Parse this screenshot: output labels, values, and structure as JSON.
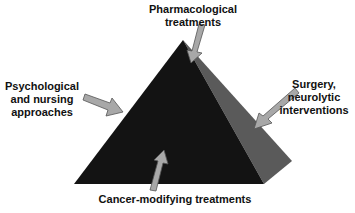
{
  "diagram": {
    "type": "pyramid",
    "colors": {
      "front_face": "#131313",
      "side_face": "#5a5a5a",
      "arrow_fill": "#a8a8a8",
      "arrow_stroke": "#555555",
      "text": "#111111",
      "background": "#ffffff"
    },
    "labels": {
      "top": {
        "line1": "Pharmacological",
        "line2": "treatments"
      },
      "left": {
        "line1": "Psychological",
        "line2": "and nursing",
        "line3": "approaches"
      },
      "right": {
        "line1": "Surgery,",
        "line2": "neurolytic",
        "line3": "interventions"
      },
      "bottom": {
        "line1": "Cancer-modifying treatments"
      }
    }
  }
}
